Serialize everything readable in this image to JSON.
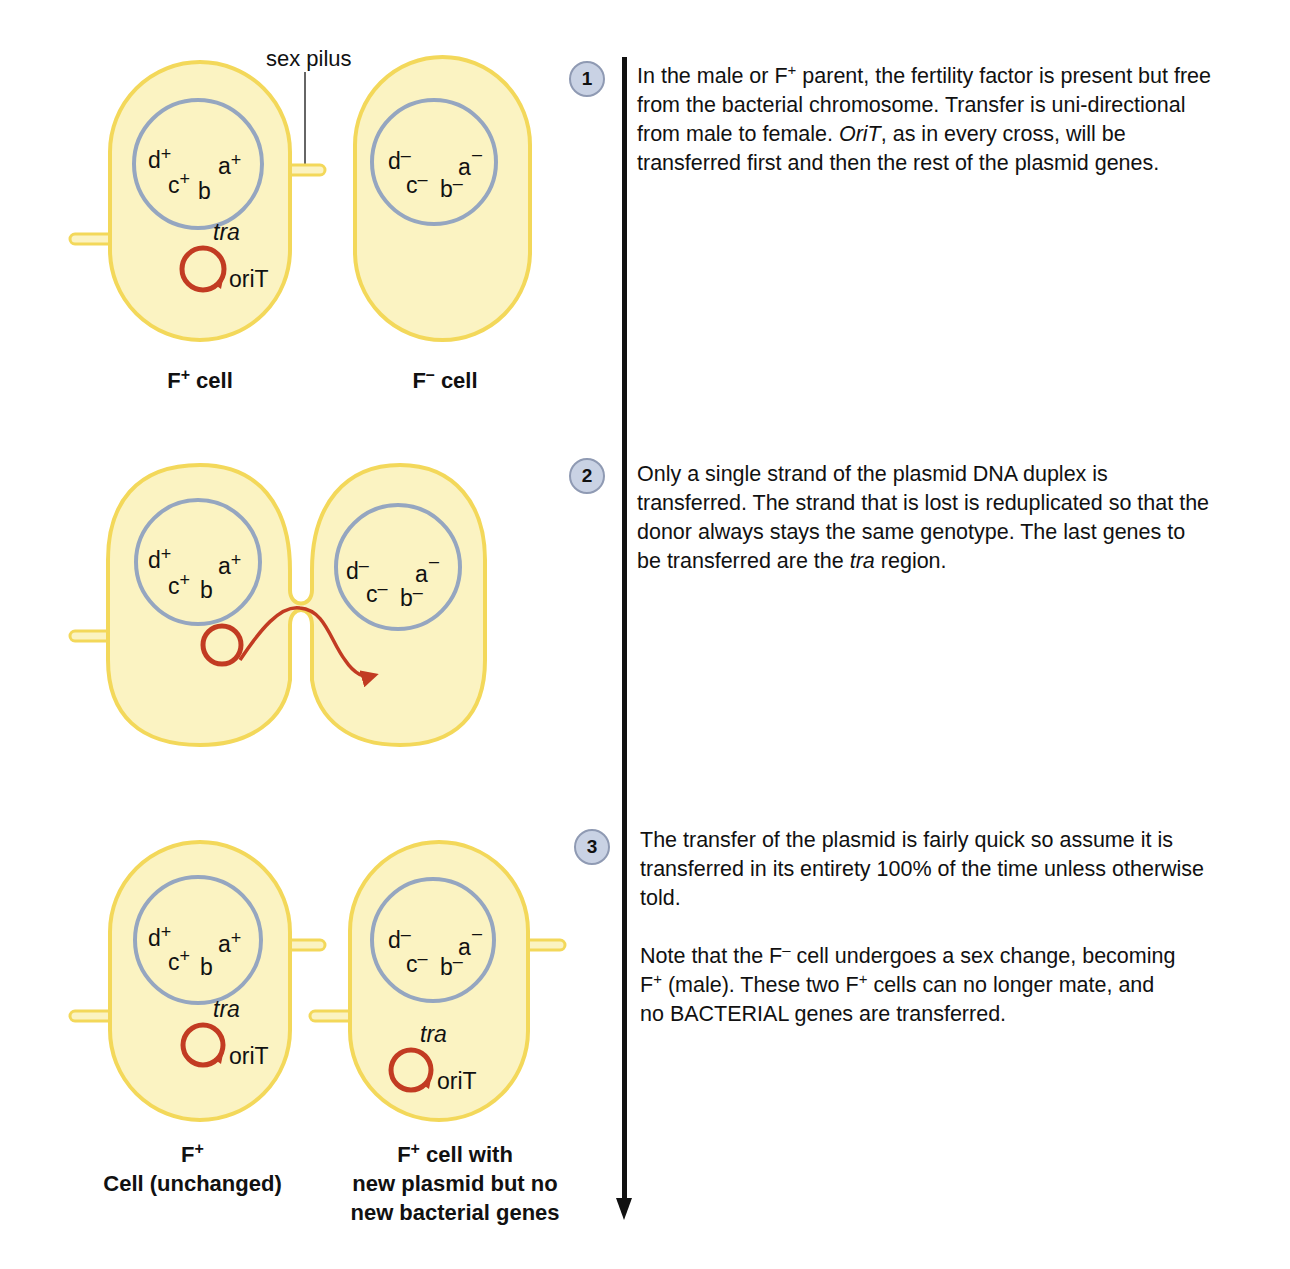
{
  "colors": {
    "cell_fill": "#fbf3c2",
    "cell_outline": "#f3d85a",
    "chromosome_ring": "#95a6c0",
    "plasmid": "#c23b22",
    "badge_fill": "#c9d2e4",
    "timeline": "#111111"
  },
  "panel1": {
    "pilus_label": "sex pilus",
    "left_cell": {
      "label_main": "F",
      "label_sup": "+",
      "label_rest": " cell",
      "genes": [
        "d",
        "+",
        "a",
        "+",
        "c",
        "+",
        "b"
      ],
      "plasmid_gene": "tra",
      "origin": "oriT"
    },
    "right_cell": {
      "label_main": "F",
      "label_sup": "–",
      "label_rest": " cell",
      "genes": [
        "d",
        "–",
        "a",
        "–",
        "c",
        "–",
        "b",
        "–"
      ]
    }
  },
  "panel2": {
    "left_genes": [
      "d",
      "+",
      "a",
      "+",
      "c",
      "+",
      "b"
    ],
    "right_genes": [
      "d",
      "–",
      "a",
      "–",
      "c",
      "–",
      "b",
      "–"
    ]
  },
  "panel3": {
    "left_cell": {
      "plasmid_gene": "tra",
      "origin": "oriT",
      "label_line1_main": "F",
      "label_line1_sup": "+",
      "label_line2": "Cell (unchanged)"
    },
    "right_cell": {
      "plasmid_gene": "tra",
      "origin": "oriT",
      "label_line1_main": "F",
      "label_line1_sup": "+",
      "label_line1_rest": " cell with",
      "label_line2": "new plasmid but no",
      "label_line3": "new bacterial genes"
    }
  },
  "steps": [
    {
      "number": "1",
      "text_parts": [
        "In the male or F",
        "+",
        " parent, the fertility factor is present but free from the bacterial chromosome. Transfer is uni-directional from male to female. ",
        "OriT",
        ", as in every cross, will be transferred first and then the rest of the plasmid genes."
      ]
    },
    {
      "number": "2",
      "text_parts": [
        "Only a single strand of the plasmid DNA duplex is transferred. The strand that is lost is reduplicated so that the donor always stays the same genotype. The last genes to be transferred are the ",
        "tra",
        " region."
      ]
    },
    {
      "number": "3",
      "paragraph1": "The transfer of the plasmid is fairly quick so assume it is transferred in its entirety 100% of the time unless otherwise told.",
      "paragraph2_parts": [
        "Note that the  F",
        "–",
        " cell undergoes a sex change, becoming F",
        "+",
        " (male). These two F",
        "+",
        " cells can no longer mate, and no BACTERIAL genes are transferred."
      ]
    }
  ]
}
